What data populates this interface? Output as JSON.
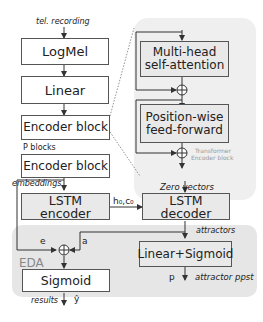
{
  "diagram": {
    "input_label": "tel. recording",
    "blocks": {
      "logmel": "LogMel",
      "linear": "Linear",
      "encoder_block_1": "Encoder block",
      "encoder_block_p": "Encoder block",
      "mhsa_line1": "Multi-head",
      "mhsa_line2": "self-attention",
      "ff_line1": "Position-wise",
      "ff_line2": "feed-forward",
      "lstm_encoder": "LSTM encoder",
      "lstm_decoder": "LSTM decoder",
      "linear_sigmoid": "Linear+Sigmoid",
      "sigmoid": "Sigmoid"
    },
    "labels": {
      "p_blocks": "P blocks",
      "embeddings": "embeddings",
      "transformer_line1": "Transformer",
      "transformer_line2": "Encoder block",
      "zero_vectors": "Zero vectors",
      "h0c0": "h₀,c₀",
      "attractors": "attractors",
      "e": "e",
      "a": "a",
      "eda": "EDA",
      "p": "p",
      "attractor_ppst": "attractor ppst",
      "results": "results",
      "y_hat": "ŷ",
      "plus": "⊕"
    }
  }
}
